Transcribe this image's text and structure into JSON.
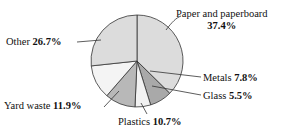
{
  "chart_data": {
    "type": "pie",
    "title": "",
    "subtitle": "",
    "xlabel": "",
    "ylabel": "",
    "legend_position": "none",
    "grid": false,
    "units": "percent",
    "total": 100.0,
    "start_angle_deg": 0,
    "direction": "clockwise",
    "categories": [
      "Paper and paperboard",
      "Metals",
      "Glass",
      "Plastics",
      "Yard waste",
      "Other"
    ],
    "values": [
      37.4,
      7.8,
      5.5,
      10.7,
      11.9,
      26.7
    ],
    "slices": [
      {
        "name": "Paper and paperboard",
        "label_line1": "Paper and paperboard",
        "value": 37.4,
        "value_text": "37.4%",
        "color": "#dcdcdc",
        "start_deg": 0.0,
        "end_deg": 134.64
      },
      {
        "name": "Metals",
        "label_line1": "Metals",
        "value": 7.8,
        "value_text": "7.8%",
        "color": "#a9a9a9",
        "start_deg": 134.64,
        "end_deg": 162.72
      },
      {
        "name": "Glass",
        "label_line1": "Glass",
        "value": 5.5,
        "value_text": "5.5%",
        "color": "#f2f2f2",
        "start_deg": 162.72,
        "end_deg": 182.52
      },
      {
        "name": "Plastics",
        "label_line1": "Plastics",
        "value": 10.7,
        "value_text": "10.7%",
        "color": "#b8b8b8",
        "start_deg": 182.52,
        "end_deg": 221.04
      },
      {
        "name": "Yard waste",
        "label_line1": "Yard waste",
        "value": 11.9,
        "value_text": "11.9%",
        "color": "#f4f4f4",
        "start_deg": 221.04,
        "end_deg": 263.88
      },
      {
        "name": "Other",
        "label_line1": "Other",
        "value": 26.7,
        "value_text": "26.7%",
        "color": "#dcdcdc",
        "start_deg": 263.88,
        "end_deg": 360.0
      }
    ],
    "geometry": {
      "center_x": 137,
      "center_y": 61,
      "radius": 46
    },
    "style": {
      "outline_color": "#333333",
      "background": "#ffffff",
      "text_color": "#111111",
      "leader_line_color": "#333333"
    }
  },
  "labels": {
    "paper": {
      "name": "Paper and paperboard",
      "percent": "37.4%"
    },
    "metals": {
      "name": "Metals",
      "percent": "7.8%"
    },
    "glass": {
      "name": "Glass",
      "percent": "5.5%"
    },
    "plastics": {
      "name": "Plastics",
      "percent": "10.7%"
    },
    "yard": {
      "name": "Yard waste",
      "percent": "11.9%"
    },
    "other": {
      "name": "Other",
      "percent": "26.7%"
    }
  }
}
